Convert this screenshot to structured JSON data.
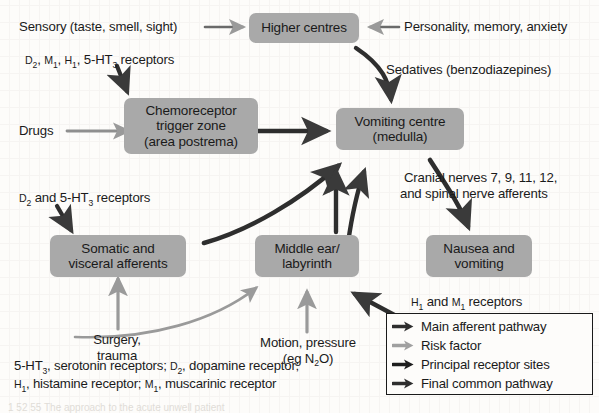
{
  "diagram": {
    "colors": {
      "node_fill": "#a9a9a9",
      "dark_arrow": "#3a3a3a",
      "light_arrow": "#9a9a9a",
      "text": "#1a1a1a",
      "page": "#fdfcfa"
    }
  },
  "nodes": [
    {
      "id": "higher-centres",
      "line1": "Higher centres",
      "line2": ""
    },
    {
      "id": "ctz",
      "line1": "Chemoreceptor",
      "line2": "trigger zone",
      "line3": "(area postrema)"
    },
    {
      "id": "vomiting-centre",
      "line1": "Vomiting centre",
      "line2": "(medulla)"
    },
    {
      "id": "somatic",
      "line1": "Somatic and",
      "line2": "visceral afferents"
    },
    {
      "id": "middle-ear",
      "line1": "Middle ear/",
      "line2": "labyrinth"
    },
    {
      "id": "nausea",
      "line1": "Nausea and",
      "line2": "vomiting"
    }
  ],
  "labels": {
    "sensory": "Sensory (taste, smell, sight)",
    "personality": "Personality, memory, anxiety",
    "sedatives": "Sedatives (benzodiazepines)",
    "drugs": "Drugs",
    "cranial_line1": "Cranial nerves 7, 9, 11, 12,",
    "cranial_line2": "and spinal nerve afferents",
    "surgery_line1": "Surgery,",
    "surgery_line2": "trauma",
    "motion_line1": "Motion, pressure",
    "motion_line2_pre": "(eg N",
    "motion_line2_sub": "2",
    "motion_line2_post": "O)"
  },
  "receptor_notes": {
    "top": {
      "r1": "D",
      "r1sub": "2",
      "sep1": ", ",
      "r2": "M",
      "r2sub": "1",
      "sep2": ", ",
      "r3": "H",
      "r3sub": "1",
      "sep3": ", ",
      "r4": "5-HT",
      "r4sub": "3",
      "tail": " receptors"
    },
    "ctz": {
      "r1": "D",
      "r1sub": "2",
      "mid": " and ",
      "r2": "5-HT",
      "r2sub": "3",
      "tail": " receptors"
    },
    "nausea": {
      "r1": "H",
      "r1sub": "1",
      "mid": " and ",
      "r2": "M",
      "r2sub": "1",
      "tail": " receptors"
    }
  },
  "legend": {
    "items": [
      {
        "label": "Main afferent pathway",
        "style": "dark",
        "icon": "arrow-right-icon"
      },
      {
        "label": "Risk factor",
        "style": "light",
        "icon": "arrow-right-icon"
      },
      {
        "label": "Principal receptor sites",
        "style": "dark",
        "icon": "arrow-right-icon"
      },
      {
        "label": "Final common pathway",
        "style": "dark",
        "icon": "arrow-right-icon"
      }
    ]
  },
  "footnote": {
    "a_abbr": "5-HT",
    "a_sub": "3",
    "a_sep": ", ",
    "a_text": "serotonin receptors; ",
    "b_abbr": "D",
    "b_sub": "2",
    "b_sep": ", ",
    "b_text": "dopamine receptor;",
    "c_abbr": "H",
    "c_sub": "1",
    "c_sep": ", ",
    "c_text": "histamine receptor; ",
    "d_abbr": "M",
    "d_sub": "1",
    "d_sep": ", ",
    "d_text": "muscarinic receptor"
  },
  "caption_bleed": "1 52 55 The approach to the acute unwell patient"
}
